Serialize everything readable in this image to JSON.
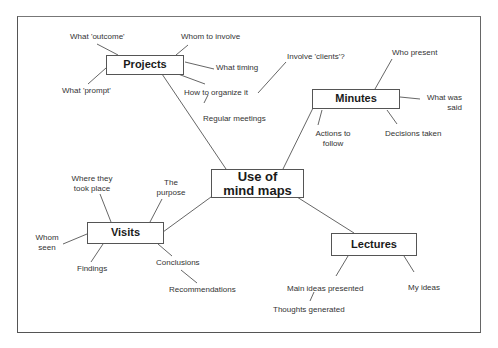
{
  "diagram": {
    "center": {
      "id": "center",
      "label_line1": "Use of",
      "label_line2": "mind maps"
    },
    "branches": [
      {
        "id": "projects",
        "label": "Projects",
        "children": [
          "What 'outcome'",
          "Whom to involve",
          "What timing",
          "What 'prompt'",
          "How to organize it",
          "Regular meetings",
          "Involve 'clients'?"
        ]
      },
      {
        "id": "minutes",
        "label": "Minutes",
        "children": [
          "Who present",
          "What was said",
          "Actions to follow",
          "Decisions taken"
        ]
      },
      {
        "id": "visits",
        "label": "Visits",
        "children": [
          "Where they took place",
          "The purpose",
          "Whom seen",
          "Findings",
          "Conclusions",
          "Recommendations"
        ]
      },
      {
        "id": "lectures",
        "label": "Lectures",
        "children": [
          "Main ideas presented",
          "Thoughts generated",
          "My ideas"
        ]
      }
    ],
    "leaves": {
      "what_outcome": "What 'outcome'",
      "whom_to_involve": "Whom to involve",
      "what_timing": "What timing",
      "what_prompt": "What 'prompt'",
      "how_to_organize": "How to organize it",
      "regular_meetings": "Regular meetings",
      "involve_clients": "Involve 'clients'?",
      "who_present": "Who present",
      "what_was_said_1": "What was",
      "what_was_said_2": "said",
      "actions_1": "Actions to",
      "actions_2": "follow",
      "decisions_taken": "Decisions taken",
      "where_1": "Where they",
      "where_2": "took place",
      "purpose_1": "The",
      "purpose_2": "purpose",
      "whom_seen_1": "Whom",
      "whom_seen_2": "seen",
      "findings": "Findings",
      "conclusions": "Conclusions",
      "recommendations": "Recommendations",
      "main_ideas": "Main ideas presented",
      "thoughts_generated": "Thoughts generated",
      "my_ideas": "My ideas"
    }
  }
}
